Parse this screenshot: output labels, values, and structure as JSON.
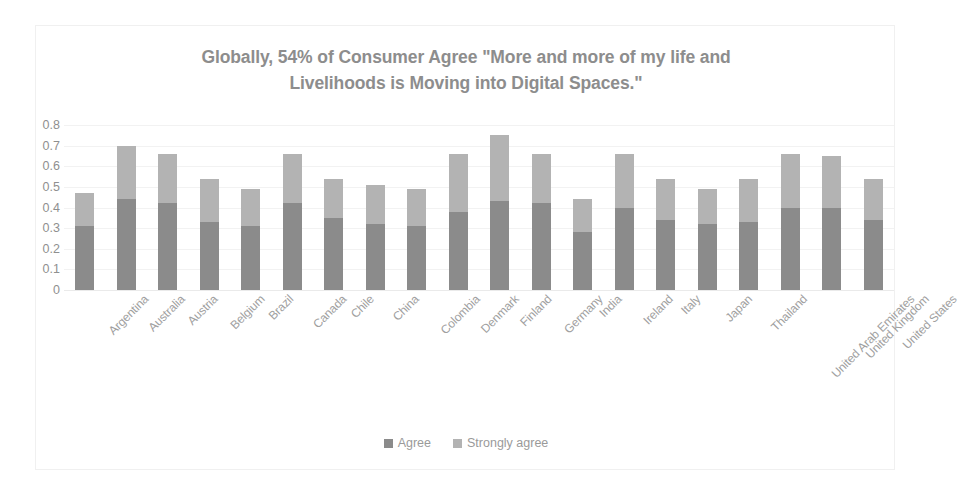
{
  "chart_data": {
    "type": "bar",
    "subtype": "stacked-column",
    "title": "Globally, 54% of Consumer Agree \"More and more of my life and Livelihoods is Moving into Digital Spaces.\"",
    "title_lines": [
      "Globally, 54% of Consumer Agree \"More and more of my life and",
      "Livelihoods is Moving into Digital Spaces.\""
    ],
    "xlabel": "",
    "ylabel": "",
    "ylim": [
      0,
      0.8
    ],
    "grid": true,
    "legend_position": "bottom",
    "ytick_labels": [
      "0.8",
      "0.7",
      "0.6",
      "0.5",
      "0.4",
      "0.3",
      "0.2",
      "0.1",
      "0"
    ],
    "ytick_values": [
      0.8,
      0.7,
      0.6,
      0.5,
      0.4,
      0.3,
      0.2,
      0.1,
      0
    ],
    "categories": [
      "Argentina",
      "Australia",
      "Austria",
      "Belgium",
      "Brazil",
      "Canada",
      "Chile",
      "China",
      "Colombia",
      "Denmark",
      "Finland",
      "Germany",
      "India",
      "Ireland",
      "Italy",
      "Japan",
      "Thailand",
      "United Arab Emirates",
      "United Kingdom",
      "United States"
    ],
    "series": [
      {
        "name": "Agree",
        "color": "#8b8b8b",
        "values": [
          0.31,
          0.44,
          0.42,
          0.33,
          0.31,
          0.42,
          0.35,
          0.32,
          0.31,
          0.38,
          0.43,
          0.42,
          0.28,
          0.4,
          0.34,
          0.32,
          0.33,
          0.4,
          0.4,
          0.34
        ]
      },
      {
        "name": "Strongly agree",
        "color": "#b3b3b3",
        "values": [
          0.16,
          0.26,
          0.24,
          0.21,
          0.18,
          0.24,
          0.19,
          0.19,
          0.18,
          0.28,
          0.32,
          0.24,
          0.16,
          0.26,
          0.2,
          0.17,
          0.21,
          0.26,
          0.25,
          0.2
        ]
      }
    ],
    "totals": [
      0.47,
      0.7,
      0.66,
      0.54,
      0.49,
      0.66,
      0.54,
      0.51,
      0.49,
      0.66,
      0.75,
      0.66,
      0.44,
      0.66,
      0.54,
      0.49,
      0.54,
      0.66,
      0.65,
      0.54
    ]
  },
  "legend": {
    "entries": [
      {
        "label": "Agree",
        "color": "#8b8b8b"
      },
      {
        "label": "Strongly agree",
        "color": "#b3b3b3"
      }
    ]
  },
  "colors": {
    "agree": "#8b8b8b",
    "strongly_agree": "#b3b3b3",
    "title_text": "#8d8d8d",
    "axis_text": "#96969 6",
    "gridline": "#f2f2f2",
    "frame_border": "#f0f0f0",
    "background": "#ffffff"
  }
}
